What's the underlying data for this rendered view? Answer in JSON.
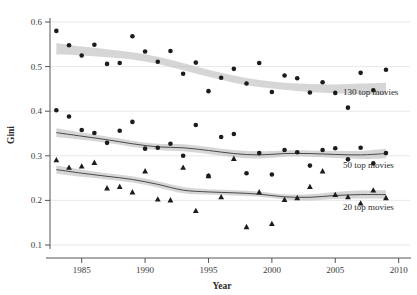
{
  "chart_data": {
    "type": "scatter",
    "title": "",
    "xlabel": "Year",
    "ylabel": "Gini",
    "xlim": [
      1982.5,
      2010.5
    ],
    "ylim": [
      0.1,
      0.6
    ],
    "xticks": [
      1985,
      1990,
      1995,
      2000,
      2005,
      2010
    ],
    "xtick_labels": [
      "1985",
      "1990",
      "1995",
      "2000",
      "2005",
      "2010"
    ],
    "yticks": [
      0.1,
      0.2,
      0.3,
      0.4,
      0.5,
      0.6
    ],
    "ytick_labels": [
      "0.1",
      "0.2",
      "0.3",
      "0.4",
      "0.5",
      "0.6"
    ],
    "grid": true,
    "legend_position": "inline-right",
    "marker_color": "#1c1c1c",
    "band_color": "#bdbdbd",
    "trend_color": "#4a4a4a",
    "series": [
      {
        "name": "130 top movies",
        "label": "130 top movies",
        "marker": "circle",
        "label_x": 2005.6,
        "label_y": 0.437,
        "x": [
          1983,
          1984,
          1985,
          1986,
          1987,
          1988,
          1989,
          1990,
          1991,
          1992,
          1993,
          1994,
          1995,
          1996,
          1997,
          1998,
          1999,
          2000,
          2001,
          2002,
          2003,
          2004,
          2005,
          2006,
          2007,
          2008,
          2009
        ],
        "y": [
          0.58,
          0.548,
          0.525,
          0.549,
          0.506,
          0.508,
          0.568,
          0.534,
          0.511,
          0.535,
          0.484,
          0.509,
          0.445,
          0.475,
          0.495,
          0.462,
          0.508,
          0.443,
          0.48,
          0.474,
          0.442,
          0.465,
          0.441,
          0.408,
          0.486,
          0.447,
          0.493
        ],
        "trend_x": [
          1983,
          1985,
          1987,
          1989,
          1991,
          1993,
          1995,
          1997,
          1999,
          2001,
          2003,
          2005,
          2007,
          2009
        ],
        "trend_y": [
          0.54,
          0.535,
          0.53,
          0.524,
          0.514,
          0.5,
          0.485,
          0.472,
          0.462,
          0.456,
          0.452,
          0.45,
          0.45,
          0.45
        ],
        "band_upper": [
          0.553,
          0.545,
          0.539,
          0.532,
          0.522,
          0.508,
          0.493,
          0.48,
          0.47,
          0.464,
          0.461,
          0.46,
          0.462,
          0.464
        ],
        "band_lower": [
          0.527,
          0.525,
          0.521,
          0.516,
          0.506,
          0.492,
          0.477,
          0.464,
          0.454,
          0.448,
          0.443,
          0.44,
          0.438,
          0.436
        ]
      },
      {
        "name": "50 top movies",
        "label": "50 top movies",
        "marker": "circle",
        "label_x": 2005.6,
        "label_y": 0.272,
        "x": [
          1983,
          1984,
          1985,
          1986,
          1987,
          1988,
          1989,
          1990,
          1991,
          1992,
          1993,
          1994,
          1995,
          1996,
          1997,
          1998,
          1999,
          2000,
          2001,
          2002,
          2003,
          2004,
          2005,
          2006,
          2007,
          2008,
          2009
        ],
        "y": [
          0.402,
          0.388,
          0.358,
          0.351,
          0.329,
          0.356,
          0.376,
          0.316,
          0.318,
          0.327,
          0.3,
          0.369,
          0.255,
          0.342,
          0.349,
          0.261,
          0.306,
          0.258,
          0.313,
          0.308,
          0.278,
          0.313,
          0.317,
          0.292,
          0.318,
          0.283,
          0.306
        ],
        "trend_x": [
          1983,
          1985,
          1987,
          1989,
          1991,
          1993,
          1995,
          1997,
          1999,
          2001,
          2003,
          2005,
          2007,
          2009
        ],
        "trend_y": [
          0.352,
          0.344,
          0.336,
          0.327,
          0.32,
          0.318,
          0.312,
          0.305,
          0.302,
          0.305,
          0.305,
          0.303,
          0.302,
          0.305
        ],
        "band_upper": [
          0.362,
          0.352,
          0.343,
          0.334,
          0.327,
          0.326,
          0.32,
          0.313,
          0.31,
          0.312,
          0.312,
          0.311,
          0.311,
          0.316
        ],
        "band_lower": [
          0.342,
          0.336,
          0.329,
          0.32,
          0.313,
          0.31,
          0.304,
          0.297,
          0.294,
          0.298,
          0.298,
          0.295,
          0.293,
          0.294
        ]
      },
      {
        "name": "20 top movies",
        "label": "20 top movies",
        "marker": "triangle",
        "label_x": 2005.6,
        "label_y": 0.178,
        "x": [
          1983,
          1984,
          1985,
          1986,
          1987,
          1988,
          1989,
          1990,
          1991,
          1992,
          1993,
          1994,
          1995,
          1996,
          1997,
          1998,
          1999,
          2000,
          2001,
          2002,
          2003,
          2004,
          2005,
          2006,
          2007,
          2008,
          2009
        ],
        "y": [
          0.291,
          0.274,
          0.277,
          0.285,
          0.228,
          0.231,
          0.219,
          0.266,
          0.203,
          0.201,
          0.274,
          0.177,
          0.255,
          0.208,
          0.294,
          0.141,
          0.219,
          0.148,
          0.202,
          0.206,
          0.231,
          0.266,
          0.213,
          0.208,
          0.194,
          0.223,
          0.206
        ],
        "trend_x": [
          1983,
          1985,
          1987,
          1989,
          1991,
          1993,
          1995,
          1997,
          1999,
          2001,
          2003,
          2005,
          2007,
          2009
        ],
        "trend_y": [
          0.269,
          0.261,
          0.254,
          0.247,
          0.236,
          0.223,
          0.219,
          0.217,
          0.214,
          0.208,
          0.207,
          0.211,
          0.213,
          0.213
        ],
        "band_upper": [
          0.278,
          0.269,
          0.261,
          0.254,
          0.243,
          0.23,
          0.225,
          0.223,
          0.22,
          0.214,
          0.214,
          0.219,
          0.222,
          0.223
        ],
        "band_lower": [
          0.26,
          0.253,
          0.247,
          0.24,
          0.229,
          0.216,
          0.213,
          0.211,
          0.208,
          0.202,
          0.2,
          0.203,
          0.204,
          0.203
        ]
      }
    ]
  }
}
